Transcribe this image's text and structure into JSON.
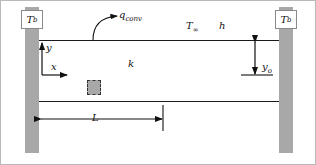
{
  "figure": {
    "background_color": "#ffffff",
    "border_color": "#b9b9b9"
  },
  "walls": {
    "material_color": "#a8a8a8",
    "left": {
      "name": "left-wall",
      "temperature_label": "T",
      "temperature_subscript": "b"
    },
    "right": {
      "name": "right-wall",
      "temperature_label": "T",
      "temperature_subscript": "b"
    }
  },
  "plate": {
    "conductivity_label": "k",
    "surface_color": "#1a1a1a"
  },
  "ambient": {
    "temperature_label": "T",
    "temperature_subscript": "∞",
    "convection_coefficient_label": "h"
  },
  "heat_flux": {
    "label": "q",
    "subscript": "conv"
  },
  "axes": {
    "vertical_label": "y",
    "horizontal_label": "x"
  },
  "dimensions": {
    "half_thickness": {
      "label": "y",
      "subscript": "o"
    },
    "length": {
      "label": "L"
    }
  },
  "control_volume": {
    "label": "differential-control-volume",
    "fill_color": "#a8a8a8",
    "border_style": "dashed"
  }
}
